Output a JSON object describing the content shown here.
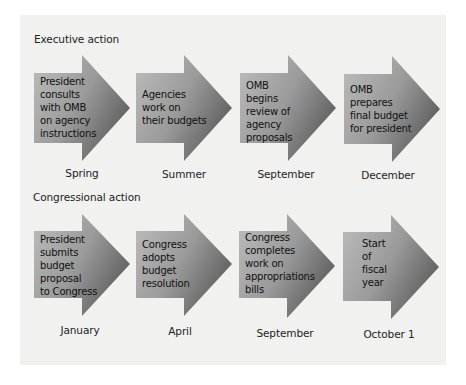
{
  "colors": {
    "panel_bg": "#f1f1f0",
    "arrow_light": "#b9b9b9",
    "arrow_dark": "#6e6e6e"
  },
  "sections": [
    {
      "title": "Executive action",
      "steps": [
        {
          "text": "President\nconsults\nwith OMB\non agency\ninstructions",
          "date": "Spring"
        },
        {
          "text": "Agencies\nwork on\ntheir budgets",
          "date": "Summer"
        },
        {
          "text": "OMB\nbegins\nreview of\nagency\nproposals",
          "date": "September"
        },
        {
          "text": "OMB\nprepares\nfinal budget\nfor president",
          "date": "December"
        }
      ]
    },
    {
      "title": "Congressional action",
      "steps": [
        {
          "text": "President\nsubmits\nbudget\nproposal\nto Congress",
          "date": "January"
        },
        {
          "text": "Congress\nadopts\nbudget\nresolution",
          "date": "April"
        },
        {
          "text": "Congress\ncompletes\nwork on\nappropriations\nbills",
          "date": "September"
        },
        {
          "text": "Start\nof\nfiscal\nyear",
          "date": "October 1"
        }
      ]
    }
  ]
}
